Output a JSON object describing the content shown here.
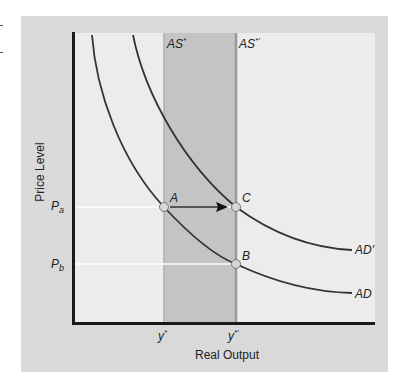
{
  "diagram": {
    "type": "aggregate_demand_supply",
    "axes": {
      "y_label": "Price Level",
      "x_label": "Real Output"
    },
    "y_ticks": [
      {
        "base": "P",
        "sub": "a"
      },
      {
        "base": "P",
        "sub": "b"
      }
    ],
    "x_ticks": [
      {
        "base": "y",
        "sup": "*"
      },
      {
        "base": "y",
        "sup": "*′"
      }
    ],
    "supply_lines": [
      {
        "base": "AS",
        "sup": "*"
      },
      {
        "base": "AS",
        "sup": "*′"
      }
    ],
    "demand_curves": [
      {
        "label": "AD"
      },
      {
        "label": "AD′"
      }
    ],
    "points": [
      {
        "label": "A"
      },
      {
        "label": "B"
      },
      {
        "label": "C"
      }
    ],
    "colors": {
      "frame": "#d9d9d9",
      "plot_bg": "#ececec",
      "shaded_band": "#c4c4c4",
      "curve": "#333333",
      "axis": "#1a1a1a",
      "guide": "#ffffff",
      "point_fill": "#d6d6d6"
    }
  }
}
